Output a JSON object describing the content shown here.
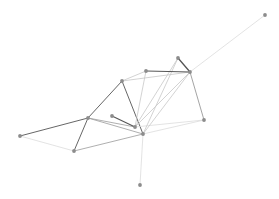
{
  "figure": {
    "title": "",
    "background_color": "#ffffff",
    "width": 279,
    "height": 199
  },
  "chart_data": {
    "type": "scatter",
    "title": "",
    "xlabel": "",
    "ylabel": "",
    "grid": false,
    "legend": null,
    "xlim": [
      0,
      279
    ],
    "ylim": [
      0,
      199
    ],
    "node_marker": "circle",
    "node_radius": 1.9,
    "node_color": "#8c8c8c",
    "node_edge_color": "#6e6e6e",
    "edge_colors": {
      "dark": "#555555",
      "medium": "#9a9a9a",
      "light": "#c8c8c8",
      "faint": "#dcdcdc"
    },
    "nodes": [
      {
        "id": "n0",
        "label": "",
        "x": 20,
        "y": 136
      },
      {
        "id": "n1",
        "label": "",
        "x": 74,
        "y": 151
      },
      {
        "id": "n2",
        "label": "",
        "x": 88,
        "y": 118
      },
      {
        "id": "n3",
        "label": "",
        "x": 112,
        "y": 116
      },
      {
        "id": "n4",
        "label": "",
        "x": 122,
        "y": 81
      },
      {
        "id": "n5",
        "label": "",
        "x": 135,
        "y": 127
      },
      {
        "id": "n6",
        "label": "",
        "x": 143,
        "y": 134
      },
      {
        "id": "n7",
        "label": "",
        "x": 146,
        "y": 71
      },
      {
        "id": "n8",
        "label": "",
        "x": 178,
        "y": 58
      },
      {
        "id": "n9",
        "label": "",
        "x": 190,
        "y": 72
      },
      {
        "id": "n10",
        "label": "",
        "x": 204,
        "y": 120
      },
      {
        "id": "n11",
        "label": "",
        "x": 265,
        "y": 15
      },
      {
        "id": "n12",
        "label": "",
        "x": 140,
        "y": 185
      }
    ],
    "edges": [
      {
        "source": "n0",
        "target": "n2",
        "color": "dark",
        "width": 0.9
      },
      {
        "source": "n1",
        "target": "n2",
        "color": "dark",
        "width": 0.9
      },
      {
        "source": "n1",
        "target": "n6",
        "color": "medium",
        "width": 0.8
      },
      {
        "source": "n2",
        "target": "n4",
        "color": "dark",
        "width": 0.9
      },
      {
        "source": "n2",
        "target": "n5",
        "color": "medium",
        "width": 0.8
      },
      {
        "source": "n2",
        "target": "n6",
        "color": "medium",
        "width": 0.8
      },
      {
        "source": "n3",
        "target": "n5",
        "color": "dark",
        "width": 1.1
      },
      {
        "source": "n4",
        "target": "n7",
        "color": "light",
        "width": 0.8
      },
      {
        "source": "n4",
        "target": "n6",
        "color": "dark",
        "width": 0.9
      },
      {
        "source": "n4",
        "target": "n9",
        "color": "light",
        "width": 0.8
      },
      {
        "source": "n5",
        "target": "n7",
        "color": "light",
        "width": 0.8
      },
      {
        "source": "n5",
        "target": "n8",
        "color": "light",
        "width": 0.8
      },
      {
        "source": "n5",
        "target": "n9",
        "color": "light",
        "width": 0.8
      },
      {
        "source": "n5",
        "target": "n10",
        "color": "faint",
        "width": 0.8
      },
      {
        "source": "n6",
        "target": "n8",
        "color": "light",
        "width": 0.8
      },
      {
        "source": "n6",
        "target": "n9",
        "color": "light",
        "width": 0.8
      },
      {
        "source": "n6",
        "target": "n10",
        "color": "faint",
        "width": 0.8
      },
      {
        "source": "n6",
        "target": "n12",
        "color": "faint",
        "width": 0.8
      },
      {
        "source": "n7",
        "target": "n9",
        "color": "dark",
        "width": 1.0
      },
      {
        "source": "n8",
        "target": "n9",
        "color": "dark",
        "width": 1.3
      },
      {
        "source": "n9",
        "target": "n10",
        "color": "medium",
        "width": 0.9
      },
      {
        "source": "n9",
        "target": "n11",
        "color": "faint",
        "width": 0.8
      },
      {
        "source": "n0",
        "target": "n1",
        "color": "faint",
        "width": 0.8
      }
    ]
  }
}
